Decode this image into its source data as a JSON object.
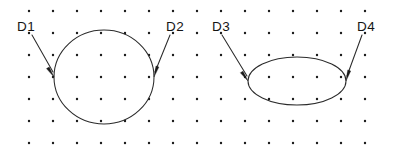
{
  "figure": {
    "background_color": "#ffffff",
    "stroke_color": "#2b2b2b",
    "dot_color": "#1a1a1a",
    "label_color": "#141414",
    "width": 400,
    "height": 157
  },
  "grid": {
    "name": "dot-grid",
    "columns": 15,
    "rows": 7,
    "origin_x": 29,
    "origin_y": 11,
    "spacing_x": 24,
    "spacing_y": 22,
    "dot_radius": 1.2
  },
  "shapes": [
    {
      "id": "circle",
      "kind": "circle",
      "cx": 104,
      "cy": 77,
      "rx": 50,
      "ry": 47
    },
    {
      "id": "ellipse",
      "kind": "ellipse",
      "cx": 297,
      "cy": 81,
      "rx": 49,
      "ry": 24
    }
  ],
  "labels": [
    {
      "id": "d1",
      "text": "D1",
      "x": 17,
      "y": 31,
      "leader": {
        "x1": 32,
        "y1": 35,
        "x2": 53,
        "y2": 72
      },
      "arrow": {
        "x": 54,
        "y": 77,
        "angle": 60
      }
    },
    {
      "id": "d2",
      "text": "D2",
      "x": 166,
      "y": 31,
      "leader": {
        "x1": 170,
        "y1": 35,
        "x2": 155,
        "y2": 72
      },
      "arrow": {
        "x": 154,
        "y": 77,
        "angle": 112
      }
    },
    {
      "id": "d3",
      "text": "D3",
      "x": 212,
      "y": 31,
      "leader": {
        "x1": 222,
        "y1": 35,
        "x2": 247,
        "y2": 76
      },
      "arrow": {
        "x": 248,
        "y": 81,
        "angle": 59
      }
    },
    {
      "id": "d4",
      "text": "D4",
      "x": 357,
      "y": 31,
      "leader": {
        "x1": 362,
        "y1": 35,
        "x2": 347,
        "y2": 76
      },
      "arrow": {
        "x": 346,
        "y": 81,
        "angle": 111
      }
    }
  ]
}
